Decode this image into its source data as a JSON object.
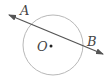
{
  "diagram": {
    "type": "geometry",
    "circle": {
      "center_label": "O",
      "cx": 53,
      "cy": 45,
      "r": 30,
      "stroke": "#b8b8b8"
    },
    "line": {
      "x1": 9,
      "y1": 15,
      "x2": 103,
      "y2": 54,
      "stroke": "#555555",
      "arrows": "both"
    },
    "points": [
      {
        "label": "A",
        "x": 26,
        "y": 13
      },
      {
        "label": "B",
        "x": 92,
        "y": 44
      },
      {
        "label": "O",
        "x": 42,
        "y": 51
      }
    ]
  }
}
